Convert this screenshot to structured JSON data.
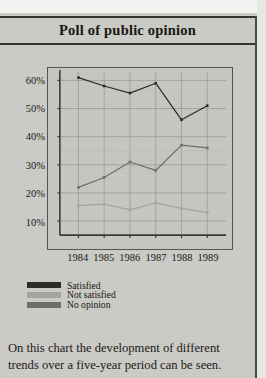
{
  "page": {
    "title": "Poll of public opinion",
    "caption_lines": [
      "On this chart the development of different",
      "trends over a five-year period can be seen."
    ]
  },
  "legend": {
    "items": [
      {
        "label": "Satisfied",
        "color": "#2b2a26"
      },
      {
        "label": "Not satisfied",
        "color": "#a5a5a0"
      },
      {
        "label": "No opinion",
        "color": "#6e6d68"
      }
    ]
  },
  "chart_data": {
    "type": "line",
    "title": "Poll of public opinion",
    "xlabel": "",
    "ylabel": "",
    "categories": [
      "1984",
      "1985",
      "1986",
      "1987",
      "1988",
      "1989"
    ],
    "x_tick_labels": [
      "1984",
      "1985",
      "1986",
      "1987",
      "1988",
      "1989"
    ],
    "y_tick_labels": [
      "10%",
      "20%",
      "30%",
      "40%",
      "50%",
      "60%"
    ],
    "y_ticks": [
      10,
      20,
      30,
      40,
      50,
      60
    ],
    "ylim": [
      5,
      63
    ],
    "grid": true,
    "legend_position": "below-left",
    "series": [
      {
        "name": "Satisfied",
        "color": "#2b2a26",
        "values": [
          61,
          58,
          55.5,
          59,
          46,
          51
        ]
      },
      {
        "name": "Not satisfied",
        "color": "#a5a5a0",
        "values": [
          15.5,
          16,
          14,
          16.5,
          14.5,
          13
        ]
      },
      {
        "name": "No opinion",
        "color": "#6e6d68",
        "values": [
          22,
          25.5,
          31,
          28,
          37,
          36
        ]
      }
    ]
  }
}
